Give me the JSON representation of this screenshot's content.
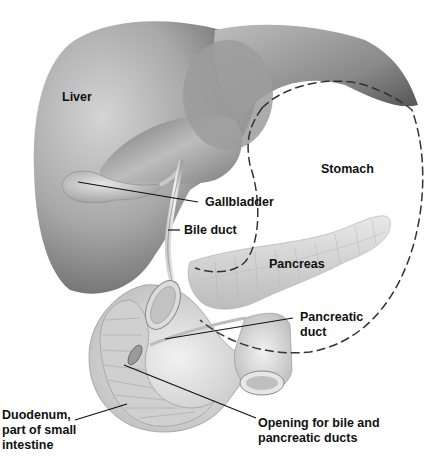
{
  "diagram": {
    "background": "#ffffff",
    "colors": {
      "liver_dark": "#5c5c5c",
      "liver_light": "#d9d9d9",
      "pancreas": "#d6d6d6",
      "duodenum": "#e2e2e2",
      "dashed_outline": "#3a3a3a",
      "label_text": "#111111",
      "leader_line": "#111111"
    },
    "labels": {
      "liver": "Liver",
      "stomach": "Stomach",
      "gallbladder": "Gallbladder",
      "bile_duct": "Bile duct",
      "pancreas": "Pancreas",
      "pancreatic_duct_line1": "Pancreatic",
      "pancreatic_duct_line2": "duct",
      "duodenum_line1": "Duodenum,",
      "duodenum_line2": "part of small",
      "duodenum_line3": "intestine",
      "opening_line1": "Opening for bile and",
      "opening_line2": "pancreatic ducts"
    },
    "structures": [
      {
        "name": "liver",
        "style": "shaded organ"
      },
      {
        "name": "gallbladder",
        "style": "shaded organ"
      },
      {
        "name": "stomach",
        "style": "dashed outline"
      },
      {
        "name": "bile-duct",
        "style": "tube"
      },
      {
        "name": "pancreas",
        "style": "lobulated organ"
      },
      {
        "name": "pancreatic-duct",
        "style": "tube"
      },
      {
        "name": "duodenum",
        "style": "cutaway tube"
      }
    ]
  }
}
